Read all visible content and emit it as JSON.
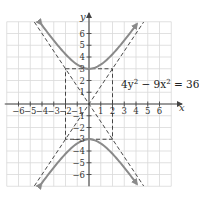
{
  "chart_data": {
    "type": "line",
    "title": "",
    "equation": "4y² − 9x² = 36",
    "equation_parts": {
      "a": "4y",
      "a_exp": "2",
      "op": " − 9x",
      "b_exp": "2",
      "rhs": " = 36"
    },
    "xlabel": "x",
    "ylabel": "y",
    "xlim": [
      -7,
      7
    ],
    "ylim": [
      -7,
      7
    ],
    "grid": true,
    "x_ticks": [
      -6,
      -5,
      -4,
      -3,
      -2,
      -1,
      1,
      2,
      3,
      4,
      5,
      6
    ],
    "y_ticks": [
      -6,
      -5,
      -4,
      -3,
      -2,
      -1,
      1,
      2,
      3,
      4,
      5,
      6
    ],
    "x_tick_labels": [
      "−6",
      "−5",
      "−4",
      "−3",
      "−2",
      "−1",
      "1",
      "2",
      "3",
      "4",
      "5",
      "6"
    ],
    "y_tick_labels_visible": [
      "6",
      "5",
      "4",
      "3",
      "2",
      "1",
      "−1",
      "−2",
      "−3",
      "−4",
      "−5",
      "−6"
    ],
    "series": [
      {
        "name": "upper branch",
        "kind": "hyperbola",
        "equation": "y = 3·sqrt(1 + x²/4)",
        "vertex": [
          0,
          3
        ],
        "style": "solid",
        "color": "#8a8a8a",
        "arrows": true
      },
      {
        "name": "lower branch",
        "kind": "hyperbola",
        "equation": "y = -3·sqrt(1 + x²/4)",
        "vertex": [
          0,
          -3
        ],
        "style": "solid",
        "color": "#8a8a8a",
        "arrows": true
      },
      {
        "name": "asymptote 1",
        "kind": "line",
        "equation": "y = (3/2)x",
        "style": "dashed",
        "color": "#333333"
      },
      {
        "name": "asymptote 2",
        "kind": "line",
        "equation": "y = -(3/2)x",
        "style": "dashed",
        "color": "#333333"
      },
      {
        "name": "fundamental rectangle",
        "kind": "rectangle",
        "corners": [
          [
            -2,
            -3
          ],
          [
            2,
            -3
          ],
          [
            2,
            3
          ],
          [
            -2,
            3
          ]
        ],
        "style": "dashed",
        "color": "#333333"
      }
    ],
    "colors": {
      "curve": "#8a8a8a",
      "axis": "#444444",
      "grid": "#d9d9d9",
      "dashed": "#333333"
    }
  }
}
